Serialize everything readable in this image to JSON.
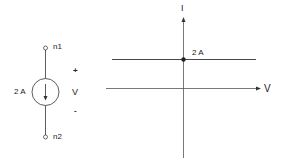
{
  "circuit": {
    "source_type": "current-source",
    "source_value": "2 A",
    "node_top": "n1",
    "node_bottom": "n2",
    "voltage_label": "V",
    "plus_sign": "+",
    "minus_sign": "-"
  },
  "iv_graph": {
    "y_axis_label": "I",
    "x_axis_label": "V",
    "intercept_label": "2 A",
    "curve": "horizontal line at I = 2 A"
  },
  "colors": {
    "line": "#333333",
    "text": "#222222"
  }
}
